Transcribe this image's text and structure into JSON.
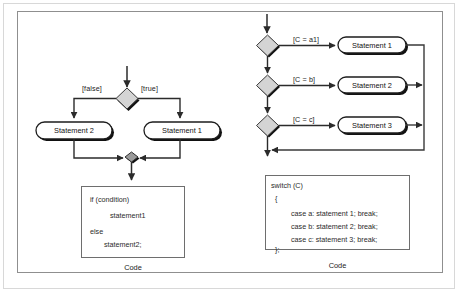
{
  "figure": {
    "title_present": false,
    "colors": {
      "page_background": "#ffffff",
      "outer_frame": "#d8d8d8",
      "diagram_frame": "#8f8f8f",
      "stroke": "#333333",
      "decision_fill": "#d4d4d4",
      "merge_fill": "#9a9a9a",
      "shadow": "#101010",
      "text": "#1b1b1b"
    }
  },
  "left_diagram": {
    "name": "if-else-activity-diagram",
    "decision_guard_false": "[false]",
    "decision_guard_true": "[true]",
    "actions": [
      {
        "id": "statement-2",
        "label": "Statement 2"
      },
      {
        "id": "statement-1",
        "label": "Statement 1"
      }
    ],
    "code_box": {
      "caption": "Code",
      "lines": [
        "if (condition)",
        "          statement1",
        "",
        "else",
        "       statement2;"
      ]
    }
  },
  "right_diagram": {
    "name": "switch-case-activity-diagram",
    "guards": [
      "[C = a1]",
      "[C = b]",
      "[C = c]"
    ],
    "actions": [
      {
        "id": "statement-1",
        "label": "Statement 1"
      },
      {
        "id": "statement-2",
        "label": "Statement 2"
      },
      {
        "id": "statement-3",
        "label": "Statement 3"
      }
    ],
    "code_box": {
      "caption": "Code",
      "lines": [
        "switch (C)",
        "  {",
        "          case a: statement 1; break;",
        "          case b: statement 2; break;",
        "          case c: statement 3; break;",
        "  };"
      ]
    }
  }
}
